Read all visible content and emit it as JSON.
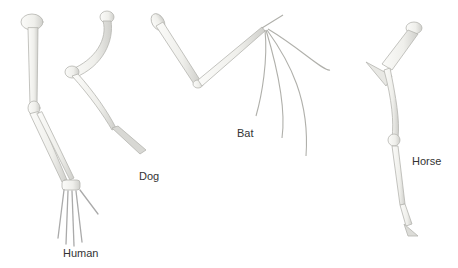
{
  "figure": {
    "labels": {
      "human": "Human",
      "dog": "Dog",
      "bat": "Bat",
      "horse": "Horse"
    },
    "colors": {
      "bone_fill": "#f2f2ee",
      "bone_stroke": "#b8b8b4",
      "shadow": "#d6d6d2",
      "text": "#333333",
      "background": "#ffffff"
    }
  }
}
